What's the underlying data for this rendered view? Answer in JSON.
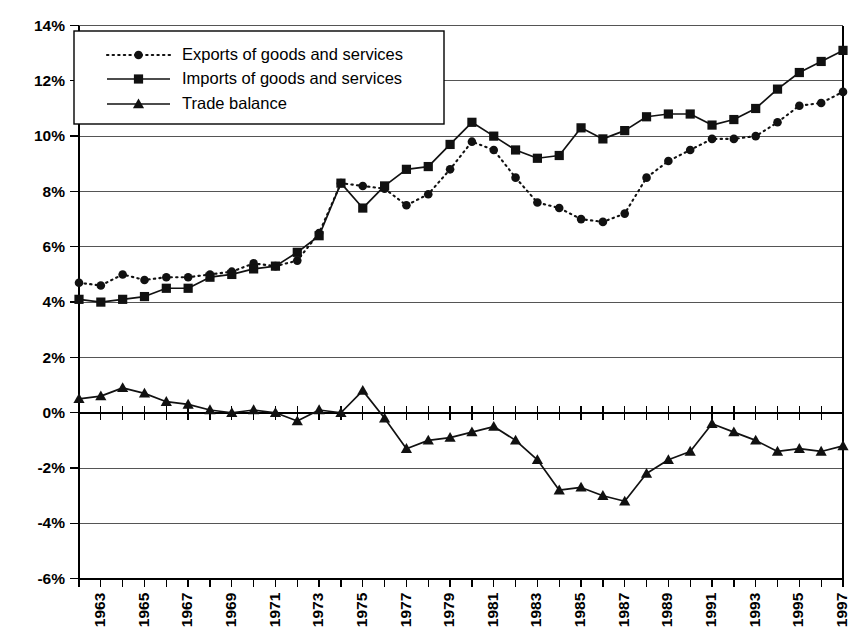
{
  "chart_data": {
    "type": "line",
    "title": "",
    "subtitle": "",
    "xlabel": "",
    "ylabel": "",
    "xlim": [
      1962,
      1997
    ],
    "ylim": [
      -6,
      14
    ],
    "ytick_step": 2,
    "grid": true,
    "legend_position": "top-left",
    "y_tick_labels": [
      "14%",
      "12%",
      "10%",
      "8%",
      "6%",
      "4%",
      "2%",
      "0%",
      "-2%",
      "-4%",
      "-6%"
    ],
    "y_tick_values": [
      14,
      12,
      10,
      8,
      6,
      4,
      2,
      0,
      -2,
      -4,
      -6
    ],
    "x": [
      1962,
      1963,
      1964,
      1965,
      1966,
      1967,
      1968,
      1969,
      1970,
      1971,
      1972,
      1973,
      1974,
      1975,
      1976,
      1977,
      1978,
      1979,
      1980,
      1981,
      1982,
      1983,
      1984,
      1985,
      1986,
      1987,
      1988,
      1989,
      1990,
      1991,
      1992,
      1993,
      1994,
      1995,
      1996,
      1997
    ],
    "x_tick_labels": [
      "1963",
      "1965",
      "1967",
      "1969",
      "1971",
      "1973",
      "1975",
      "1977",
      "1979",
      "1981",
      "1983",
      "1985",
      "1987",
      "1989",
      "1991",
      "1993",
      "1995",
      "1997"
    ],
    "x_tick_values": [
      1963,
      1965,
      1967,
      1969,
      1971,
      1973,
      1975,
      1977,
      1979,
      1981,
      1983,
      1985,
      1987,
      1989,
      1991,
      1993,
      1995,
      1997
    ],
    "series": [
      {
        "name": "Exports of goods and services",
        "marker": "circle",
        "line_style": "dotted",
        "color": "#111111",
        "values": [
          4.7,
          4.6,
          5.0,
          4.8,
          4.9,
          4.9,
          5.0,
          5.1,
          5.4,
          5.3,
          5.5,
          6.5,
          8.3,
          8.2,
          8.1,
          7.5,
          7.9,
          8.8,
          9.8,
          9.5,
          8.5,
          7.6,
          7.4,
          7.0,
          6.9,
          7.2,
          8.5,
          9.1,
          9.5,
          9.9,
          9.9,
          10.0,
          10.5,
          11.1,
          11.2,
          11.6
        ]
      },
      {
        "name": "Imports of goods and services",
        "marker": "square",
        "line_style": "solid",
        "color": "#111111",
        "values": [
          4.1,
          4.0,
          4.1,
          4.2,
          4.5,
          4.5,
          4.9,
          5.0,
          5.2,
          5.3,
          5.8,
          6.4,
          8.3,
          7.4,
          8.2,
          8.8,
          8.9,
          9.7,
          10.5,
          10.0,
          9.5,
          9.2,
          9.3,
          10.3,
          9.9,
          10.2,
          10.7,
          10.8,
          10.8,
          10.4,
          10.6,
          11.0,
          11.7,
          12.3,
          12.7,
          13.1
        ]
      },
      {
        "name": "Trade balance",
        "marker": "triangle",
        "line_style": "solid",
        "color": "#111111",
        "values": [
          0.5,
          0.6,
          0.9,
          0.7,
          0.4,
          0.3,
          0.1,
          0.0,
          0.1,
          0.0,
          -0.3,
          0.1,
          0.0,
          0.8,
          -0.2,
          -1.3,
          -1.0,
          -0.9,
          -0.7,
          -0.5,
          -1.0,
          -1.7,
          -2.8,
          -2.7,
          -3.0,
          -3.2,
          -2.2,
          -1.7,
          -1.4,
          -0.4,
          -0.7,
          -1.0,
          -1.4,
          -1.3,
          -1.4,
          -1.2
        ]
      }
    ]
  },
  "legend": {
    "items": [
      {
        "label": "Exports of goods and services"
      },
      {
        "label": "Imports of goods and services"
      },
      {
        "label": "Trade balance"
      }
    ]
  }
}
